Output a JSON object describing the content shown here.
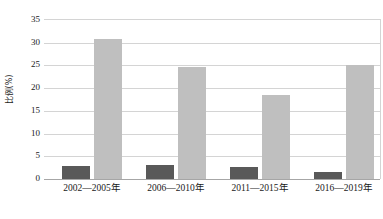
{
  "chart_data": {
    "type": "bar",
    "title": "",
    "xlabel": "",
    "ylabel": "比例(%)",
    "ylim": [
      0,
      35
    ],
    "yticks": [
      0,
      5,
      10,
      15,
      20,
      25,
      30,
      35
    ],
    "ytick_labels": [
      "0",
      "5",
      "10",
      "15",
      "20",
      "25",
      "30",
      "35"
    ],
    "grid": true,
    "legend": "none",
    "categories": [
      "2002—2005年",
      "2006—2010年",
      "2011—2015年",
      "2016—2019年"
    ],
    "series": [
      {
        "name": "series-a",
        "color": "#595959",
        "values": [
          2.9,
          3.1,
          2.7,
          1.6
        ]
      },
      {
        "name": "series-b",
        "color": "#bfbfbf",
        "values": [
          30.9,
          24.6,
          18.6,
          25.1
        ]
      }
    ]
  },
  "axis": {
    "y_title": "比例(%)",
    "tick_0": "0",
    "tick_5": "5",
    "tick_10": "10",
    "tick_15": "15",
    "tick_20": "20",
    "tick_25": "25",
    "tick_30": "30",
    "tick_35": "35"
  },
  "xlabels": {
    "cat_0": "2002—2005年",
    "cat_1": "2006—2010年",
    "cat_2": "2011—2015年",
    "cat_3": "2016—2019年"
  },
  "colors": {
    "series_a": "#595959",
    "series_b": "#bfbfbf",
    "gridline": "#d4d4d4",
    "axis": "#a6a6a6",
    "text": "#1a1a1a",
    "background": "#ffffff"
  }
}
